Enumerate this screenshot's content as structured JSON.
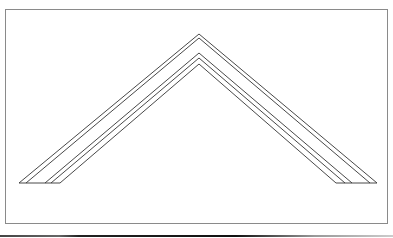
{
  "diagram": {
    "type": "nested-chevrons",
    "stroke_color": "#333333",
    "frame_color": "#8a8a8a",
    "baseline_y": 183,
    "apex_x": 199,
    "chevrons": [
      {
        "apex_y": 34,
        "left_x": 19,
        "right_x": 377
      },
      {
        "apex_y": 38,
        "left_x": 26,
        "right_x": 370
      },
      {
        "apex_y": 53,
        "left_x": 45,
        "right_x": 352
      },
      {
        "apex_y": 58,
        "left_x": 51,
        "right_x": 345
      },
      {
        "apex_y": 64,
        "left_x": 60,
        "right_x": 336
      }
    ],
    "base_segments": [
      {
        "x1": 19,
        "x2": 60
      },
      {
        "x1": 336,
        "x2": 377
      }
    ]
  }
}
